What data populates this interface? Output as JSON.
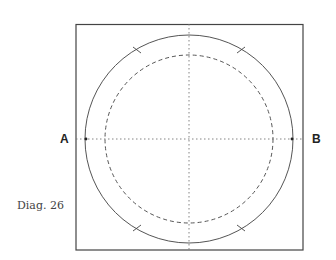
{
  "labels": {
    "left": "A",
    "right": "B"
  },
  "caption": "Diag. 26",
  "geometry": {
    "frame": {
      "x": 76,
      "y": 24,
      "width": 227,
      "height": 226
    },
    "center": {
      "x": 189,
      "y": 139
    },
    "outer_circle_radius": 104,
    "inner_dashed_circle_radius": 84
  },
  "colors": {
    "line": "#555555",
    "background": "#ffffff"
  }
}
